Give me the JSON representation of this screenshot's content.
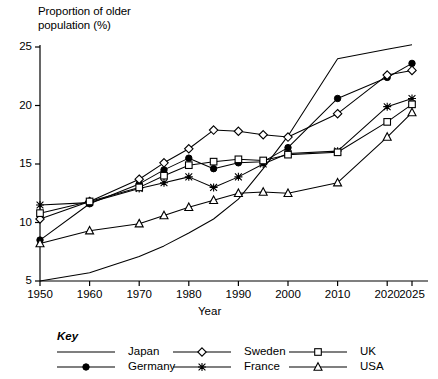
{
  "axis_title_y_line1": "Proportion of older",
  "axis_title_y_line2": "population (%)",
  "axis_title_x": "Year",
  "key_word": "Key",
  "legend": [
    {
      "name": "Japan",
      "marker": "none",
      "marker_icon": "plain-line-icon"
    },
    {
      "name": "Germany",
      "marker": "filled-circle",
      "marker_icon": "filled-circle-icon"
    },
    {
      "name": "Sweden",
      "marker": "open-diamond",
      "marker_icon": "open-diamond-icon"
    },
    {
      "name": "France",
      "marker": "star",
      "marker_icon": "star-icon"
    },
    {
      "name": "UK",
      "marker": "open-square",
      "marker_icon": "open-square-icon"
    },
    {
      "name": "USA",
      "marker": "open-triangle",
      "marker_icon": "open-triangle-icon"
    }
  ],
  "colors": {
    "ink": "#000000",
    "background": "#ffffff"
  },
  "chart_data": {
    "type": "line",
    "title": "",
    "xlabel": "Year",
    "ylabel": "Proportion of older population (%)",
    "xlim": [
      1950,
      2025
    ],
    "ylim": [
      5,
      25
    ],
    "xticks": [
      1950,
      1960,
      1970,
      1980,
      1990,
      2000,
      2010,
      2020,
      2025
    ],
    "yticks": [
      5,
      10,
      15,
      20,
      25
    ],
    "grid": false,
    "legend_position": "below-axes",
    "x": [
      1950,
      1960,
      1970,
      1975,
      1980,
      1985,
      1990,
      1995,
      2000,
      2010,
      2020,
      2025
    ],
    "series": [
      {
        "name": "Japan",
        "marker": "none",
        "x": [
          1950,
          1960,
          1970,
          1975,
          1980,
          1985,
          1990,
          1995,
          2000,
          2010,
          2020,
          2025
        ],
        "values": [
          5.0,
          5.7,
          7.1,
          8.0,
          9.1,
          10.3,
          12.0,
          14.6,
          17.4,
          24.0,
          24.8,
          25.2
        ]
      },
      {
        "name": "Germany",
        "marker": "filled-circle",
        "x": [
          1950,
          1960,
          1970,
          1975,
          1980,
          1985,
          1990,
          1995,
          2000,
          2010,
          2020,
          2025
        ],
        "values": [
          8.5,
          11.6,
          13.3,
          14.5,
          15.5,
          14.6,
          15.1,
          15.2,
          16.4,
          20.6,
          22.4,
          23.6
        ]
      },
      {
        "name": "Sweden",
        "marker": "open-diamond",
        "x": [
          1950,
          1960,
          1970,
          1975,
          1980,
          1985,
          1990,
          1995,
          2000,
          2010,
          2020,
          2025
        ],
        "values": [
          10.3,
          11.8,
          13.7,
          15.1,
          16.3,
          17.9,
          17.8,
          17.5,
          17.3,
          19.3,
          22.6,
          23.0
        ]
      },
      {
        "name": "France",
        "marker": "star",
        "x": [
          1950,
          1960,
          1970,
          1975,
          1980,
          1985,
          1990,
          1995,
          2000,
          2010,
          2020,
          2025
        ],
        "values": [
          11.5,
          11.7,
          12.9,
          13.4,
          13.9,
          13.0,
          13.9,
          15.0,
          15.9,
          16.1,
          19.9,
          20.6
        ]
      },
      {
        "name": "UK",
        "marker": "open-square",
        "x": [
          1950,
          1960,
          1970,
          1975,
          1980,
          1985,
          1990,
          1995,
          2000,
          2010,
          2020,
          2025
        ],
        "values": [
          10.8,
          11.8,
          13.0,
          14.0,
          14.9,
          15.2,
          15.4,
          15.3,
          15.8,
          16.0,
          18.6,
          20.1
        ]
      },
      {
        "name": "USA",
        "marker": "open-triangle",
        "x": [
          1950,
          1960,
          1970,
          1975,
          1980,
          1985,
          1990,
          1995,
          2000,
          2010,
          2020,
          2025
        ],
        "values": [
          8.2,
          9.3,
          9.9,
          10.6,
          11.3,
          11.9,
          12.5,
          12.6,
          12.5,
          13.4,
          17.3,
          19.4
        ]
      }
    ]
  }
}
